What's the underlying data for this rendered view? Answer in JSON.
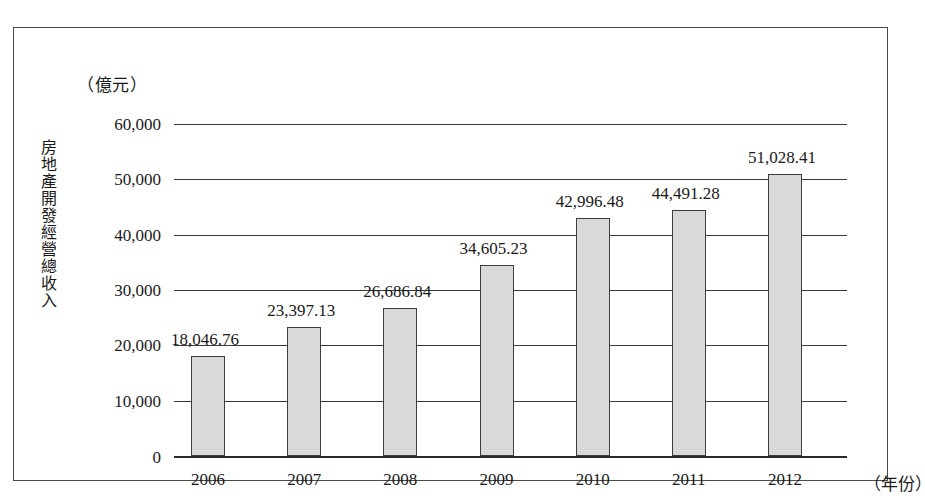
{
  "figure": {
    "unit_caption": "（億元）",
    "y_axis_title": "房地產開發經營總收入",
    "x_axis_unit": "（年份）"
  },
  "chart_data": {
    "type": "bar",
    "title": "",
    "subtitle": "",
    "xlabel": "（年份）",
    "ylabel": "房地產開發經營總收入",
    "unit": "億元",
    "categories": [
      "2006",
      "2007",
      "2008",
      "2009",
      "2010",
      "2011",
      "2012"
    ],
    "values": [
      18046.76,
      23397.13,
      26686.84,
      34605.23,
      42996.48,
      44491.28,
      51028.41
    ],
    "data_labels": [
      "18,046.76",
      "23,397.13",
      "26,686.84",
      "34,605.23",
      "42,996.48",
      "44,491.28",
      "51,028.41"
    ],
    "ylim": [
      0,
      60000
    ],
    "ytick_values": [
      0,
      10000,
      20000,
      30000,
      40000,
      50000,
      60000
    ],
    "ytick_labels": [
      "0",
      "10,000",
      "20,000",
      "30,000",
      "40,000",
      "50,000",
      "60,000"
    ],
    "grid": true,
    "grid_axis": "y",
    "legend": false,
    "legend_position": "none",
    "bar_fill_color": "#d9d9d9",
    "bar_edge_color": "#3d3d3d",
    "axis_color": "#3a3a3a",
    "background_color": "#ffffff"
  }
}
